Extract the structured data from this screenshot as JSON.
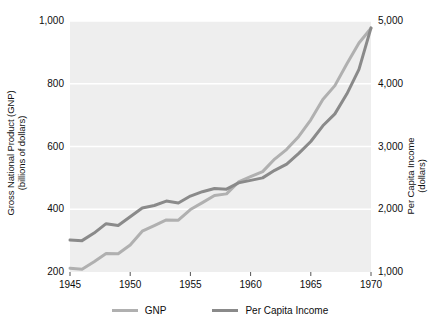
{
  "chart_data": {
    "type": "line",
    "title": "",
    "xlabel": "",
    "grid": "horizontal",
    "legend_position": "bottom",
    "x": [
      1945,
      1946,
      1947,
      1948,
      1949,
      1950,
      1951,
      1952,
      1953,
      1954,
      1955,
      1956,
      1957,
      1958,
      1959,
      1960,
      1961,
      1962,
      1963,
      1964,
      1965,
      1966,
      1967,
      1968,
      1969,
      1970
    ],
    "xlim": [
      1945,
      1970
    ],
    "xticks": [
      1945,
      1950,
      1955,
      1960,
      1965,
      1970
    ],
    "xtick_labels": [
      "1945",
      "1950",
      "1955",
      "1960",
      "1965",
      "1970"
    ],
    "axes": [
      {
        "id": "left",
        "label": "Gross National Product (GNP) (billions of dollars)",
        "label_lines": [
          "Gross National Product (GNP)",
          "(billions of dollars)"
        ],
        "lim": [
          200,
          1000
        ],
        "ticks": [
          200,
          400,
          600,
          800,
          1000
        ],
        "tick_labels": [
          "200",
          "400",
          "600",
          "800",
          "1,000"
        ]
      },
      {
        "id": "right",
        "label": "Per Capita Income (dollars)",
        "label_lines": [
          "Per Capita Income",
          "(dollars)"
        ],
        "lim": [
          1000,
          5000
        ],
        "ticks": [
          1000,
          2000,
          3000,
          4000,
          5000
        ],
        "tick_labels": [
          "1,000",
          "2,000",
          "3,000",
          "4,000",
          "5,000"
        ]
      }
    ],
    "series": [
      {
        "name": "GNP",
        "axis": "left",
        "color": "#b0b0b0",
        "units": "billions of dollars",
        "values": [
          212,
          209,
          233,
          259,
          258,
          286,
          330,
          348,
          366,
          365,
          399,
          421,
          444,
          449,
          487,
          504,
          520,
          560,
          591,
          632,
          685,
          750,
          794,
          864,
          930,
          977
        ]
      },
      {
        "name": "Per Capita Income",
        "axis": "right",
        "color": "#8a8a8a",
        "units": "dollars",
        "values": [
          1510,
          1500,
          1620,
          1770,
          1740,
          1880,
          2020,
          2060,
          2130,
          2100,
          2210,
          2280,
          2330,
          2320,
          2420,
          2460,
          2500,
          2620,
          2720,
          2890,
          3080,
          3330,
          3520,
          3840,
          4230,
          4890
        ]
      }
    ]
  },
  "legend": {
    "items": [
      {
        "label": "GNP",
        "color": "#b0b0b0"
      },
      {
        "label": "Per Capita Income",
        "color": "#8a8a8a"
      }
    ]
  },
  "plot": {
    "background": "#eeeeee",
    "gridline_color": "#ffffff"
  }
}
